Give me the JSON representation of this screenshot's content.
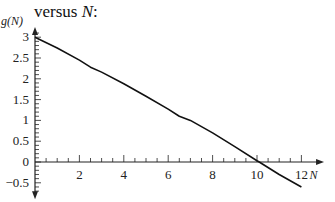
{
  "caption": {
    "prefix": "versus ",
    "var": "N",
    "suffix": ":"
  },
  "chart_data": {
    "type": "line",
    "title": "",
    "xlabel": "N",
    "ylabel": "g(N)",
    "xlim": [
      0,
      12.6
    ],
    "ylim": [
      -0.8,
      3.3
    ],
    "xticks": [
      2,
      4,
      6,
      8,
      10,
      12
    ],
    "yticks": [
      -0.5,
      0,
      0.5,
      1,
      1.5,
      2,
      2.5,
      3
    ],
    "grid": false,
    "series": [
      {
        "name": "g(N)",
        "x": [
          0,
          1,
          2,
          2.5,
          3,
          4,
          5,
          6,
          6.5,
          7,
          8,
          9,
          10,
          10.1,
          11,
          12
        ],
        "y": [
          3.0,
          2.74,
          2.45,
          2.28,
          2.16,
          1.88,
          1.58,
          1.27,
          1.1,
          1.0,
          0.7,
          0.37,
          0.03,
          0.0,
          -0.3,
          -0.6
        ]
      }
    ]
  }
}
